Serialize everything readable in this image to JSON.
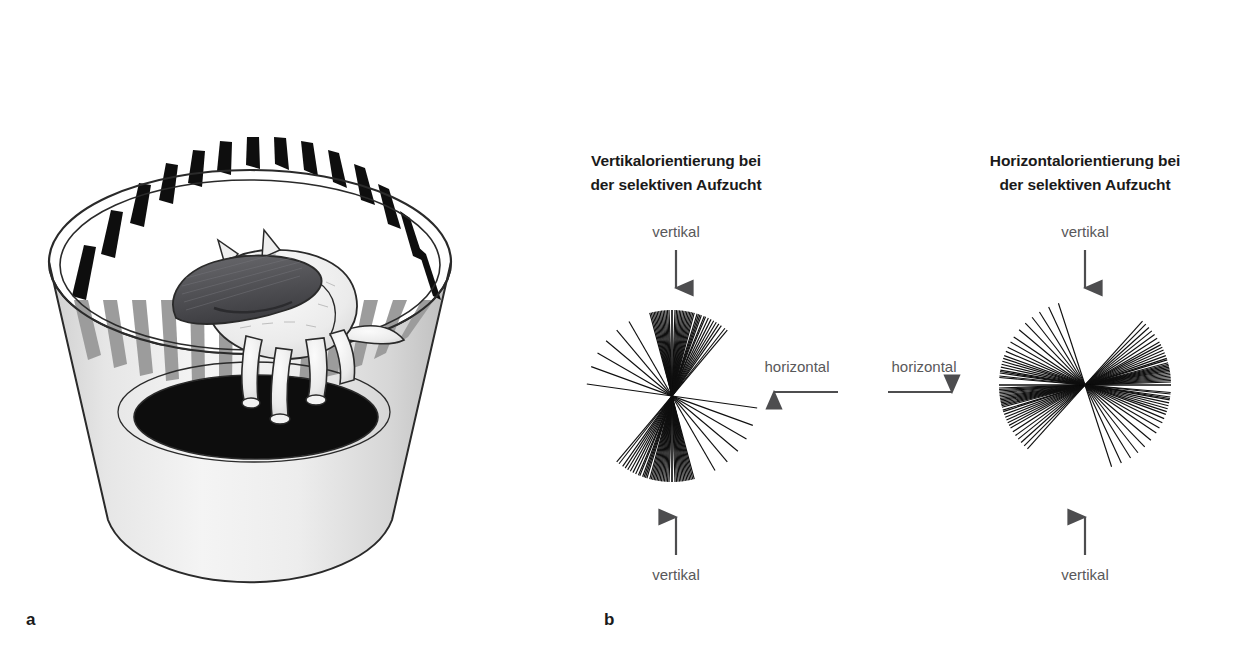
{
  "figure": {
    "background_color": "#ffffff",
    "panels": [
      {
        "letter": "a",
        "name": "striped-drum-with-kitten",
        "description_visible_text": []
      },
      {
        "letter": "b",
        "name": "orientation-fan-diagrams"
      }
    ]
  },
  "panel_a": {
    "letter_label": "a",
    "colors": {
      "stripe_dark": "#101010",
      "stripe_light": "#ffffff",
      "stripe_shadow": "#9a9a9a",
      "drum_body": "#e8e8e8",
      "drum_body_shade": "#c9c9c9",
      "floor": "#0d0d0d",
      "outline": "#1a1a1a",
      "cat_fur": "#f0f0f0",
      "cat_outline": "#2a2a2a",
      "collar": "#555558"
    }
  },
  "panel_b": {
    "letter_label": "b",
    "charts": [
      {
        "id": "vertical-reared",
        "title_line1": "Vertikalorientierung bei",
        "title_line2": "der selektiven Aufzucht",
        "top_label": "vertikal",
        "bottom_label": "vertikal",
        "side_label": "horizontal",
        "side_label_position": "right",
        "side_arrow_direction": "left",
        "top_arrow_direction": "down",
        "bottom_arrow_direction": "up"
      },
      {
        "id": "horizontal-reared",
        "title_line1": "Horizontalorientierung bei",
        "title_line2": "der selektiven Aufzucht",
        "top_label": "vertikal",
        "bottom_label": "vertikal",
        "side_label": "horizontal",
        "side_label_position": "left",
        "side_arrow_direction": "right",
        "top_arrow_direction": "down",
        "bottom_arrow_direction": "up"
      }
    ]
  },
  "chart_data": {
    "type": "scatter",
    "xlabel": "",
    "ylabel": "",
    "grid": false,
    "legend_position": "none",
    "charts": [
      {
        "id": "vertical-reared",
        "title": "Vertikalorientierung bei der selektiven Aufzucht",
        "type": "polar-line-fan",
        "axis_annotations": {
          "top": "vertikal",
          "bottom": "vertikal",
          "right": "horizontal"
        },
        "units": "degrees",
        "note": "0 deg = horizontal (3 o'clock), 90 deg = vertical (12 o'clock). Lines are drawn as full diameters through the centre.",
        "n_lines": 46,
        "angles_deg": [
          90,
          90,
          88,
          87,
          86,
          85,
          84,
          83,
          82,
          81,
          80,
          79,
          78,
          77,
          76,
          75,
          73,
          72,
          71,
          70,
          68,
          67,
          65,
          63,
          61,
          59,
          57,
          55,
          52,
          50,
          105,
          104,
          103,
          102,
          101,
          100,
          99,
          98,
          97,
          96,
          95,
          94,
          93,
          92,
          120,
          130,
          140,
          150,
          160,
          172
        ],
        "density_peak_deg": 90,
        "density_minimum_deg": 0
      },
      {
        "id": "horizontal-reared",
        "title": "Horizontalorientierung bei der selektiven Aufzucht",
        "type": "polar-line-fan",
        "axis_annotations": {
          "top": "vertikal",
          "bottom": "vertikal",
          "left": "horizontal"
        },
        "units": "degrees",
        "note": "0 deg = horizontal (3 o'clock), 90 deg = vertical (12 o'clock). Lines are drawn as full diameters through the centre.",
        "n_lines": 46,
        "angles_deg": [
          0,
          0,
          2,
          3,
          4,
          5,
          6,
          7,
          8,
          9,
          10,
          11,
          12,
          13,
          14,
          15,
          17,
          18,
          20,
          22,
          24,
          26,
          28,
          30,
          33,
          36,
          39,
          42,
          45,
          48,
          175,
          174,
          172,
          171,
          170,
          168,
          166,
          164,
          162,
          160,
          157,
          154,
          150,
          146,
          140,
          134,
          128,
          122,
          115,
          108
        ],
        "density_peak_deg": 0,
        "density_minimum_deg": 90
      }
    ]
  }
}
